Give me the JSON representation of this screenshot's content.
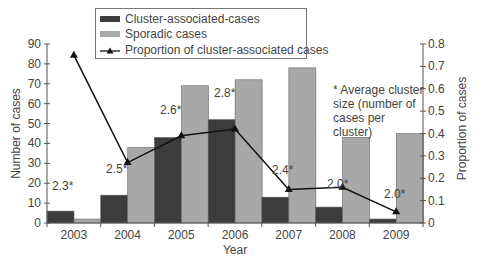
{
  "chart_data": {
    "type": "bar",
    "combo": "bar+line",
    "title": "",
    "xlabel": "Year",
    "ylabel": "Number of cases",
    "ylabel_right": "Proportion of cases",
    "categories": [
      "2003",
      "2004",
      "2005",
      "2006",
      "2007",
      "2008",
      "2009"
    ],
    "series": [
      {
        "name": "Cluster-associated-cases",
        "type": "bar",
        "axis": "left",
        "color": "#3c3c3c",
        "values": [
          6,
          14,
          43,
          52,
          13,
          8,
          2
        ]
      },
      {
        "name": "Sporadic cases",
        "type": "bar",
        "axis": "left",
        "color": "#a8a8a8",
        "values": [
          2,
          38,
          69,
          72,
          78,
          43,
          45
        ]
      },
      {
        "name": "Proportion of cluster-associated cases",
        "type": "line",
        "axis": "right",
        "color": "#111111",
        "marker": "triangle",
        "values": [
          0.75,
          0.27,
          0.39,
          0.42,
          0.15,
          0.16,
          0.05
        ]
      }
    ],
    "point_annotations": [
      "2.3*",
      "2.5*",
      "2.6*",
      "2.8*",
      "2.4*",
      "2.0*",
      "2.0*"
    ],
    "ylim": [
      0,
      90
    ],
    "ylim_right": [
      0,
      0.8
    ],
    "yticks": [
      "0",
      "10",
      "20",
      "30",
      "40",
      "50",
      "60",
      "70",
      "80",
      "90"
    ],
    "yticks_right": [
      "0",
      "0.1",
      "0.2",
      "0.3",
      "0.4",
      "0.5",
      "0.6",
      "0.7",
      "0.8"
    ],
    "grid": false,
    "legend_position": "top-center",
    "note": "* Average cluster size (number of cases per cluster)"
  },
  "legend": {
    "cluster": "Cluster-associated-cases",
    "sporadic": "Sporadic cases",
    "proportion": "Proportion of cluster-associated cases"
  },
  "note_lines": [
    "* Average cluster",
    "size (number of",
    "cases per cluster)"
  ]
}
